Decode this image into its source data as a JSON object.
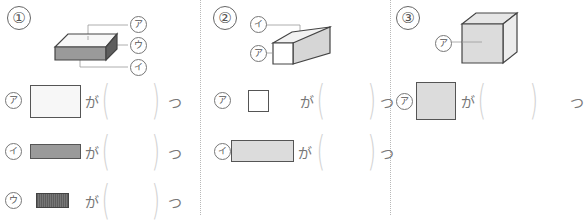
{
  "problems": [
    {
      "number": "①",
      "figure": "flat rectangular box (cuboid)",
      "figure_labels": [
        "ア",
        "ウ",
        "イ"
      ],
      "rows": [
        {
          "label": "ア",
          "face": "large light rectangle",
          "ga": "が",
          "answer": "",
          "unit": "つ"
        },
        {
          "label": "イ",
          "face": "long gray rectangle",
          "ga": "が",
          "answer": "",
          "unit": "つ"
        },
        {
          "label": "ウ",
          "face": "small dark striped rectangle",
          "ga": "が",
          "answer": "",
          "unit": "つ"
        }
      ]
    },
    {
      "number": "②",
      "figure": "long square prism",
      "figure_labels": [
        "イ",
        "ア"
      ],
      "rows": [
        {
          "label": "ア",
          "face": "small white square",
          "ga": "が",
          "answer": "",
          "unit": "つ"
        },
        {
          "label": "イ",
          "face": "long light-gray rectangle",
          "ga": "が",
          "answer": "",
          "unit": "つ"
        }
      ]
    },
    {
      "number": "③",
      "figure": "cube",
      "figure_labels": [
        "ア"
      ],
      "rows": [
        {
          "label": "ア",
          "face": "light-gray square",
          "ga": "が",
          "answer": "",
          "unit": "つ"
        }
      ]
    }
  ],
  "colors": {
    "face_white": "#f7f7f7",
    "face_light_gray": "#dcdcdc",
    "face_mid_gray": "#9a9a9a",
    "face_dark": "#5e5e5e",
    "outline": "#555555",
    "paren": "#d2d2d2"
  }
}
